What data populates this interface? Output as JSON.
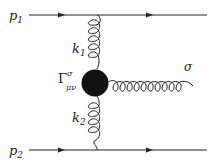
{
  "diagram": {
    "type": "feynman",
    "labels": {
      "p1": "p",
      "p1_sub": "1",
      "p2": "p",
      "p2_sub": "2",
      "k1": "k",
      "k1_sub": "1",
      "k2": "k",
      "k2_sub": "2",
      "vertex": "Γ",
      "vertex_sup": "σ",
      "vertex_sub": "μν",
      "sigma": "σ"
    },
    "colors": {
      "line": "#222222",
      "blob": "#111111"
    }
  }
}
